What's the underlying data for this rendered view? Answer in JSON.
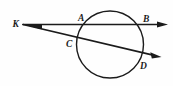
{
  "figure": {
    "background_color": "#fefefe",
    "stroke_color": "#1b1b1b",
    "width": 173,
    "height": 86
  },
  "circle": {
    "name": "circle",
    "center_x": 110,
    "center_y": 44.5,
    "radius": 33.5,
    "stroke_width": 1.4
  },
  "points": [
    {
      "id": "K",
      "label": "K",
      "x": 23,
      "y": 24.5,
      "label_x": 12.5,
      "label_y": 27,
      "role": "external-vertex"
    },
    {
      "id": "A",
      "label": "A",
      "x": 83,
      "y": 24.5,
      "label_x": 78,
      "label_y": 21,
      "role": "near-intersection-upper"
    },
    {
      "id": "B",
      "label": "B",
      "x": 142,
      "y": 24.5,
      "label_x": 143,
      "label_y": 21.5,
      "role": "far-intersection-upper"
    },
    {
      "id": "C",
      "label": "C",
      "x": 78,
      "y": 42,
      "label_x": 66,
      "label_y": 47,
      "role": "near-intersection-lower"
    },
    {
      "id": "D",
      "label": "D",
      "x": 141,
      "y": 57,
      "label_x": 140,
      "label_y": 69,
      "role": "far-intersection-lower"
    }
  ],
  "rays": [
    {
      "id": "ray-KB",
      "name": "ray-k-a-b",
      "from_x": 23,
      "from_y": 24.5,
      "to_x": 163,
      "to_y": 24.5,
      "passes_through": [
        "K",
        "A",
        "B"
      ],
      "stroke_width": 1.5,
      "arrowhead": {
        "tip_x": 168,
        "tip_y": 24.5
      }
    },
    {
      "id": "ray-KD",
      "name": "ray-k-c-d",
      "from_x": 23,
      "from_y": 24.5,
      "to_x": 155,
      "to_y": 55.5,
      "passes_through": [
        "K",
        "C",
        "D"
      ],
      "stroke_width": 1.5,
      "arrowhead": {
        "tip_x": 161,
        "tip_y": 57
      }
    }
  ],
  "labels": {
    "K": "K",
    "A": "A",
    "B": "B",
    "C": "C",
    "D": "D"
  }
}
